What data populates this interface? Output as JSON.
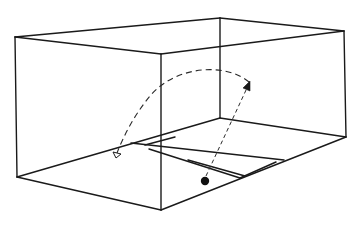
{
  "diagram": {
    "title": "",
    "colors": {
      "line": "#1a1a1a",
      "background": "#ffffff",
      "ball": "#111111"
    },
    "box": {
      "vertices": {
        "top_left_back": [
          15,
          37
        ],
        "top_back_right": [
          220,
          18
        ],
        "top_far_right": [
          344,
          31
        ],
        "top_front": [
          161,
          54
        ],
        "bottom_left": [
          17,
          177
        ],
        "bottom_front": [
          161,
          210
        ],
        "bottom_right": [
          346,
          137
        ],
        "bottom_back_hidden": [
          220,
          118
        ]
      }
    },
    "floor_markings": {
      "description": "Service box lines on the floor",
      "lines": 4
    },
    "ball": {
      "position": [
        205,
        180
      ],
      "radius": 4
    },
    "trajectories": [
      {
        "name": "arc-shot",
        "style": "dashed",
        "from": [
          248,
          82
        ],
        "to": [
          115,
          155
        ],
        "arrow_at": "end"
      },
      {
        "name": "direct-shot",
        "style": "dashed",
        "from": [
          205,
          178
        ],
        "to": [
          250,
          84
        ],
        "arrow_at": "end"
      }
    ],
    "labels": []
  }
}
